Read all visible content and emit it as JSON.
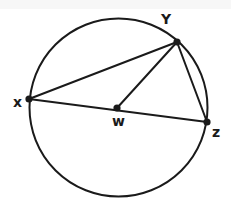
{
  "figure": {
    "type": "circle-geometry-diagram",
    "background_color": "#ffffff",
    "stroke_color": "#1a1a1a",
    "label_color": "#1a1a1a",
    "stroke_width": 2,
    "point_radius": 3.6,
    "label_font_size": 14
  },
  "circle": {
    "name": "circle-w",
    "center_x": 118.5,
    "center_y": 107.5,
    "radius": 89
  },
  "points": [
    {
      "id": "W",
      "label": "w",
      "cx": 117,
      "cy": 108,
      "label_x": 112,
      "label_y": 126,
      "role": "center"
    },
    {
      "id": "X",
      "label": "x",
      "cx": 29,
      "cy": 99,
      "label_x": 13,
      "label_y": 107,
      "role": "on-circle"
    },
    {
      "id": "Y",
      "label": "Y",
      "cx": 177,
      "cy": 42,
      "label_x": 161,
      "label_y": 24,
      "role": "on-circle"
    },
    {
      "id": "Z",
      "label": "z",
      "cx": 207,
      "cy": 122,
      "label_x": 212,
      "label_y": 137,
      "role": "on-circle"
    }
  ],
  "segments": [
    {
      "name": "segment-xy",
      "from": "X",
      "to": "Y",
      "x1": 29,
      "y1": 99,
      "x2": 177,
      "y2": 42
    },
    {
      "name": "segment-xz",
      "from": "X",
      "to": "Z",
      "x1": 29,
      "y1": 99,
      "x2": 207,
      "y2": 122
    },
    {
      "name": "segment-wy",
      "from": "W",
      "to": "Y",
      "x1": 117,
      "y1": 108,
      "x2": 177,
      "y2": 42
    },
    {
      "name": "segment-yz",
      "from": "Y",
      "to": "Z",
      "x1": 177,
      "y1": 42,
      "x2": 207,
      "y2": 122
    }
  ],
  "chart_data": {
    "type": "diagram",
    "shapes": [
      {
        "shape": "circle",
        "label": "circle W",
        "center": [
          118.5,
          107.5
        ],
        "radius": 89
      },
      {
        "shape": "point",
        "label": "W",
        "at": [
          117,
          108
        ]
      },
      {
        "shape": "point",
        "label": "X",
        "at": [
          29,
          99
        ]
      },
      {
        "shape": "point",
        "label": "Y",
        "at": [
          177,
          42
        ]
      },
      {
        "shape": "point",
        "label": "Z",
        "at": [
          207,
          122
        ]
      },
      {
        "shape": "segment",
        "label": "XY",
        "endpoints": [
          [
            29,
            99
          ],
          [
            177,
            42
          ]
        ]
      },
      {
        "shape": "segment",
        "label": "XZ (diameter through W)",
        "endpoints": [
          [
            29,
            99
          ],
          [
            207,
            122
          ]
        ]
      },
      {
        "shape": "segment",
        "label": "WY (radius)",
        "endpoints": [
          [
            117,
            108
          ],
          [
            177,
            42
          ]
        ]
      },
      {
        "shape": "segment",
        "label": "YZ (chord)",
        "endpoints": [
          [
            177,
            42
          ],
          [
            207,
            122
          ]
        ]
      }
    ]
  }
}
